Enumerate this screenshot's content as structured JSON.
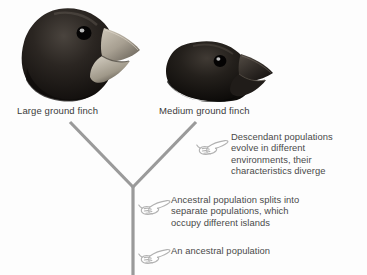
{
  "background_color": "#fdfdfd",
  "diagram": {
    "title_text_color": "#3b3b3b",
    "branch_color": "#9a9a9a",
    "hand_icon_color": "#b0b0b0"
  },
  "specimens": [
    {
      "name": "large-ground-finch",
      "label": "Large ground finch",
      "head_color": "#1d1a18",
      "beak_color": "#b9b2a4",
      "eye_color": "#000000"
    },
    {
      "name": "medium-ground-finch",
      "label": "Medium ground finch",
      "head_color": "#17150f",
      "beak_color": "#2a2622",
      "eye_color": "#000000"
    }
  ],
  "annotations": [
    {
      "name": "descendant-populations",
      "icon": "pointing-hand-icon",
      "text": "Descendant populations\nevolve in different\nenvironments, their\ncharacteristics diverge"
    },
    {
      "name": "ancestral-population-splits",
      "icon": "pointing-hand-icon",
      "text": "Ancestral population splits into\nseparate populations, which\noccupy different islands"
    },
    {
      "name": "an-ancestral-population",
      "icon": "pointing-hand-icon",
      "text": "An ancestral population"
    }
  ]
}
